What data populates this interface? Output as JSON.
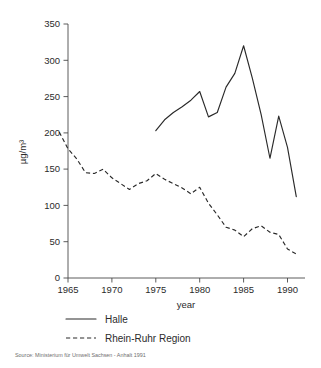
{
  "figure": {
    "source_note": "Source: Ministerium für Umwelt Sachsen - Anhalt 1991"
  },
  "legend": {
    "position": "below-axis",
    "entries": [
      {
        "label": "Halle",
        "style": "solid"
      },
      {
        "label": "Rhein-Ruhr Region",
        "style": "dashed"
      }
    ]
  },
  "axis": {
    "x_title": "year",
    "y_title": "µg/m³",
    "x_ticks": [
      "1965",
      "1970",
      "1975",
      "1980",
      "1985",
      "1990"
    ],
    "y_ticks": [
      "0",
      "50",
      "100",
      "150",
      "200",
      "250",
      "300",
      "350"
    ]
  },
  "chart_data": {
    "type": "line",
    "title": "",
    "xlabel": "year",
    "ylabel": "µg/m³",
    "xlim": [
      1964,
      1991
    ],
    "ylim": [
      0,
      350
    ],
    "xticks": [
      1965,
      1970,
      1975,
      1980,
      1985,
      1990
    ],
    "yticks": [
      0,
      50,
      100,
      150,
      200,
      250,
      300,
      350
    ],
    "grid": false,
    "legend_position": "below",
    "annotations": [
      "Source: Ministerium für Umwelt Sachsen - Anhalt 1991"
    ],
    "series": [
      {
        "name": "Halle",
        "style": "solid",
        "x": [
          1975,
          1976,
          1977,
          1978,
          1979,
          1980,
          1981,
          1982,
          1983,
          1984,
          1985,
          1986,
          1987,
          1988,
          1989,
          1990,
          1991
        ],
        "values": [
          203,
          218,
          228,
          236,
          245,
          257,
          222,
          228,
          263,
          282,
          320,
          275,
          225,
          165,
          223,
          180,
          112
        ]
      },
      {
        "name": "Rhein-Ruhr Region",
        "style": "dashed",
        "x": [
          1964,
          1965,
          1966,
          1967,
          1968,
          1969,
          1970,
          1971,
          1972,
          1973,
          1974,
          1975,
          1976,
          1977,
          1978,
          1979,
          1980,
          1981,
          1982,
          1983,
          1984,
          1985,
          1986,
          1987,
          1988,
          1989,
          1990,
          1991
        ],
        "values": [
          201,
          178,
          164,
          145,
          144,
          150,
          138,
          130,
          122,
          130,
          134,
          144,
          136,
          130,
          124,
          116,
          125,
          103,
          87,
          70,
          66,
          57,
          68,
          72,
          63,
          60,
          40,
          33
        ]
      }
    ]
  }
}
